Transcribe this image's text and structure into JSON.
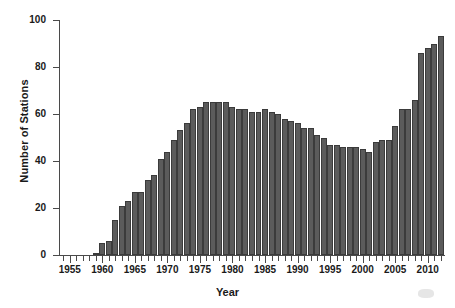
{
  "chart_data": {
    "type": "bar",
    "title": "",
    "subtitle": "",
    "xlabel": "Year",
    "ylabel": "Number of Stations",
    "xlim": [
      1953.5,
      2012.5
    ],
    "ylim": [
      0,
      100
    ],
    "grid": false,
    "legend": null,
    "annotations": [],
    "bar_color": "#5b5b5b",
    "bar_edge_color": "#3b3b3b",
    "axis_color": "#4a4a4a",
    "text_color": "#1a1a1a",
    "ytick_labels": [
      "0",
      "20",
      "40",
      "60",
      "80",
      "100"
    ],
    "ytick_values": [
      0,
      20,
      40,
      60,
      80,
      100
    ],
    "xtick_labels": [
      "1955",
      "1960",
      "1965",
      "1970",
      "1975",
      "1980",
      "1985",
      "1990",
      "1995",
      "2000",
      "2005",
      "2010"
    ],
    "xtick_values": [
      1955,
      1960,
      1965,
      1970,
      1975,
      1980,
      1985,
      1990,
      1995,
      2000,
      2005,
      2010
    ],
    "categories": [
      1955,
      1956,
      1957,
      1958,
      1959,
      1960,
      1961,
      1962,
      1963,
      1964,
      1965,
      1966,
      1967,
      1968,
      1969,
      1970,
      1971,
      1972,
      1973,
      1974,
      1975,
      1976,
      1977,
      1978,
      1979,
      1980,
      1981,
      1982,
      1983,
      1984,
      1985,
      1986,
      1987,
      1988,
      1989,
      1990,
      1991,
      1992,
      1993,
      1994,
      1995,
      1996,
      1997,
      1998,
      1999,
      2000,
      2001,
      2002,
      2003,
      2004,
      2005,
      2006,
      2007,
      2008,
      2009,
      2010,
      2011,
      2012
    ],
    "values": [
      0,
      0,
      0,
      0,
      1,
      5,
      6,
      15,
      21,
      23,
      27,
      27,
      32,
      34,
      41,
      44,
      49,
      53,
      56,
      62,
      63,
      65,
      65,
      65,
      65,
      63,
      62,
      62,
      61,
      61,
      62,
      61,
      60,
      58,
      57,
      56,
      54,
      54,
      51,
      50,
      47,
      47,
      46,
      46,
      46,
      45,
      44,
      48,
      49,
      49,
      55,
      62,
      62,
      66,
      86,
      88,
      90,
      93
    ],
    "series": [
      {
        "name": "Number of Stations",
        "values": [
          0,
          0,
          0,
          0,
          1,
          5,
          6,
          15,
          21,
          23,
          27,
          27,
          32,
          34,
          41,
          44,
          49,
          53,
          56,
          62,
          63,
          65,
          65,
          65,
          65,
          63,
          62,
          62,
          61,
          61,
          62,
          61,
          60,
          58,
          57,
          56,
          54,
          54,
          51,
          50,
          47,
          47,
          46,
          46,
          46,
          45,
          44,
          48,
          49,
          49,
          55,
          62,
          62,
          66,
          86,
          88,
          90,
          93
        ]
      }
    ]
  }
}
